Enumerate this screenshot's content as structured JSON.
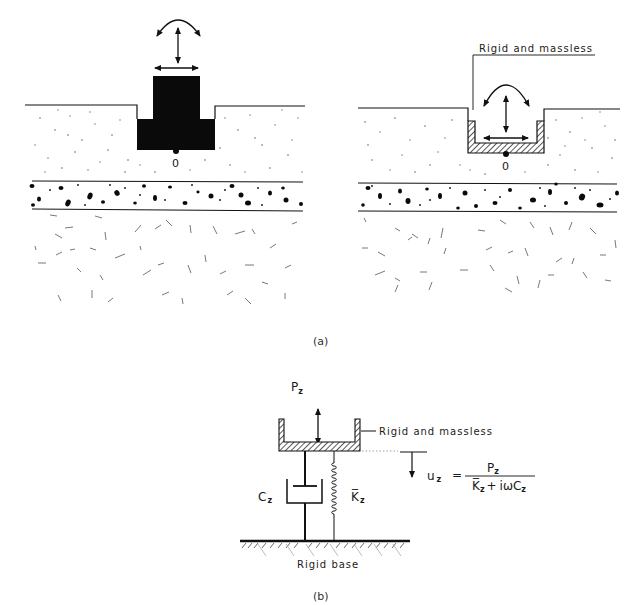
{
  "figure": {
    "panel_a": {
      "caption": "(a)",
      "left": {
        "origin_label": "0",
        "foundation": "solid-embedded-block"
      },
      "right": {
        "origin_label": "0",
        "foundation": "hatched-massless-shell",
        "annotation": "Rigid and massless"
      }
    },
    "panel_b": {
      "caption": "(b)",
      "load_label": "P",
      "load_sub": "z",
      "container_annotation": "Rigid and massless",
      "damper_label": "C",
      "damper_sub": "z",
      "spring_label": "K̅",
      "spring_sub": "z",
      "base_label": "Rigid base",
      "formula": {
        "lhs": "u",
        "lhs_sub": "z",
        "equals": "=",
        "numerator": "P",
        "numerator_sub": "z",
        "denominator_k": "K̅",
        "denominator_k_sub": "z",
        "denominator_plus": "+",
        "denominator_iw": "iωC",
        "denominator_c_sub": "z"
      }
    }
  },
  "colors": {
    "ink": "#111111",
    "background": "#ffffff",
    "speckle": "#555555"
  }
}
